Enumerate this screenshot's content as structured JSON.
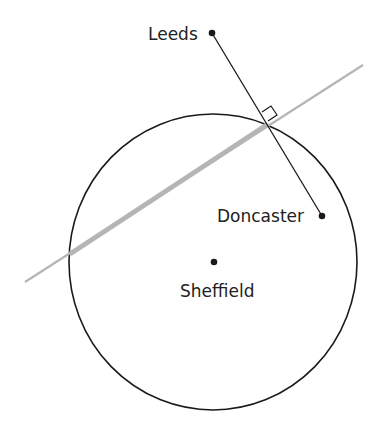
{
  "diagram": {
    "colors": {
      "ink": "#1a1a1a",
      "chord": "#b5b5b5",
      "background": "#ffffff"
    },
    "circle": {
      "cx": 213,
      "cy": 262,
      "rx": 144,
      "ry": 148
    },
    "bisector_line": {
      "x1": 25,
      "y1": 282,
      "x2": 363,
      "y2": 65
    },
    "chord": {
      "x1": 70,
      "y1": 254,
      "x2": 268,
      "y2": 124
    },
    "connector": {
      "x1": 212,
      "y1": 33,
      "x2": 322,
      "y2": 216
    },
    "right_angle_marker": "M262,112 L271,106 L277,115 L268,121",
    "points": [
      {
        "name": "Leeds",
        "x": 212,
        "y": 33,
        "label_x": 148,
        "label_y": 40
      },
      {
        "name": "Doncaster",
        "x": 322,
        "y": 216,
        "label_x": 217,
        "label_y": 222
      },
      {
        "name": "Sheffield",
        "x": 214,
        "y": 262,
        "label_x": 180,
        "label_y": 297
      }
    ]
  }
}
